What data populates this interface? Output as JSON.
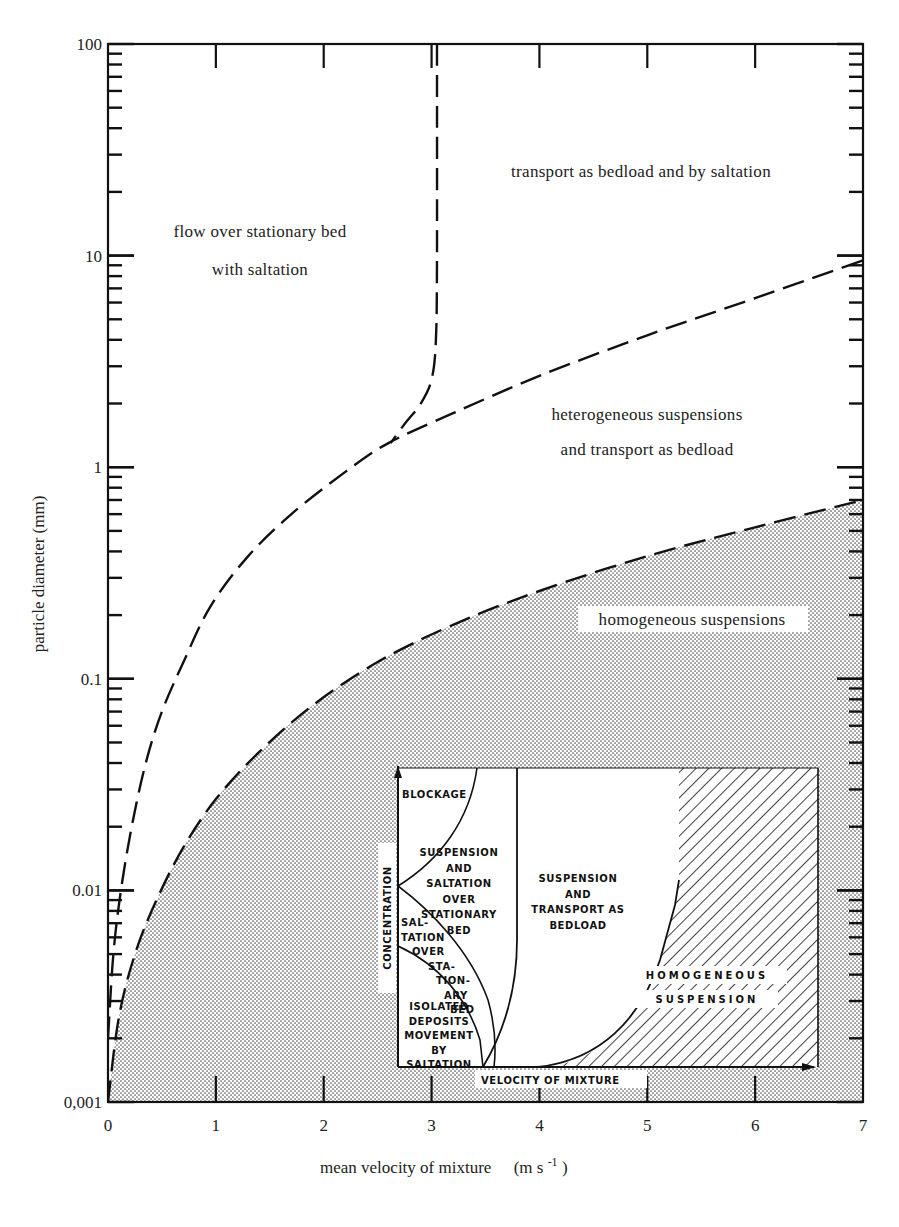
{
  "chart_data": [
    {
      "type": "area",
      "title": "",
      "xlabel": "mean velocity of mixture",
      "xlabel_units": "(m s-1)",
      "ylabel": "particle diameter (mm)",
      "yscale": "log",
      "xlim": [
        0,
        7
      ],
      "ylim": [
        0.001,
        100
      ],
      "x_ticks": [
        "0",
        "1",
        "2",
        "3",
        "4",
        "5",
        "6",
        "7"
      ],
      "y_ticks": [
        "0,001",
        "0.01",
        "0.1",
        "1",
        "10",
        "100"
      ],
      "grid": false,
      "series": [
        {
          "name": "boundary: stationary bed / bedload (vertical)",
          "style": "long-dash",
          "x": [
            3.05,
            3.05,
            3.04,
            3.0,
            2.9,
            2.75,
            2.62
          ],
          "y": [
            100,
            10,
            4,
            2.6,
            2.0,
            1.6,
            1.3
          ]
        },
        {
          "name": "boundary: bedload / heterogeneous suspension",
          "style": "long-dash",
          "x": [
            0.0,
            0.05,
            0.12,
            0.22,
            0.35,
            0.5,
            0.7,
            0.95,
            1.3,
            1.7,
            2.2,
            2.6,
            3.2,
            4.0,
            5.0,
            6.0,
            7.0
          ],
          "y": [
            0.002,
            0.005,
            0.01,
            0.02,
            0.04,
            0.07,
            0.12,
            0.22,
            0.38,
            0.6,
            0.95,
            1.3,
            1.8,
            2.7,
            4.2,
            6.3,
            9.5
          ]
        },
        {
          "name": "boundary: heterogeneous / homogeneous suspension",
          "style": "long-dash",
          "fill_below": "dotted",
          "x": [
            0.0,
            0.1,
            0.25,
            0.45,
            0.7,
            1.0,
            1.4,
            1.9,
            2.5,
            3.2,
            4.0,
            5.0,
            6.0,
            7.0
          ],
          "y": [
            0.001,
            0.0025,
            0.005,
            0.009,
            0.016,
            0.027,
            0.045,
            0.075,
            0.12,
            0.18,
            0.26,
            0.38,
            0.52,
            0.7
          ]
        }
      ],
      "annotations": [
        {
          "text": "flow over stationary bed",
          "x": 1.7,
          "y": 15
        },
        {
          "text": "with saltation",
          "x": 1.7,
          "y": 9
        },
        {
          "text": "transport as bedload and by saltation",
          "x": 5.1,
          "y": 35
        },
        {
          "text": "heterogeneous suspensions",
          "x": 5.0,
          "y": 1.5
        },
        {
          "text": "and transport as bedload",
          "x": 5.0,
          "y": 0.95
        },
        {
          "text": "homogeneous suspensions",
          "x": 5.5,
          "y": 0.17
        }
      ]
    },
    {
      "type": "diagram",
      "title": "inset: regime diagram",
      "xlabel": "VELOCITY OF MIXTURE",
      "ylabel": "CONCENTRATION",
      "regions": [
        {
          "label": [
            "BLOCKAGE"
          ]
        },
        {
          "label": [
            "SUSPENSION",
            "AND",
            "SALTATION",
            "OVER",
            "STATIONARY",
            "BED"
          ]
        },
        {
          "label": [
            "SAL-",
            "TATION",
            "OVER",
            "STA-",
            "TION-",
            "ARY",
            "BED"
          ]
        },
        {
          "label": [
            "ISOLATED",
            "DEPOSITS",
            "MOVEMENT",
            "BY",
            "SALTATION"
          ]
        },
        {
          "label": [
            "SUSPENSION",
            "AND",
            "TRANSPORT AS",
            "BEDLOAD"
          ]
        },
        {
          "label": [
            "HOMOGENEOUS",
            "SUSPENSION"
          ],
          "fill": "hatched"
        }
      ]
    }
  ],
  "axes": {
    "x": {
      "title": "mean velocity of mixture",
      "units_main": "(m s",
      "units_exp": "-1",
      "units_close": ")",
      "ticks": [
        {
          "label": "0",
          "value": 0
        },
        {
          "label": "1",
          "value": 1
        },
        {
          "label": "2",
          "value": 2
        },
        {
          "label": "3",
          "value": 3
        },
        {
          "label": "4",
          "value": 4
        },
        {
          "label": "5",
          "value": 5
        },
        {
          "label": "6",
          "value": 6
        },
        {
          "label": "7",
          "value": 7
        }
      ]
    },
    "y": {
      "title": "particle diameter (mm)",
      "ticks": [
        {
          "label": "100",
          "exp": 2
        },
        {
          "label": "10",
          "exp": 1
        },
        {
          "label": "1",
          "exp": 0
        },
        {
          "label": "0.1",
          "exp": -1
        },
        {
          "label": "0.01",
          "exp": -2
        },
        {
          "label": "0,001",
          "exp": -3
        }
      ]
    }
  },
  "labels": {
    "flow_stationary_1": "flow over stationary bed",
    "flow_stationary_2": "with saltation",
    "bedload_saltation": "transport as bedload and by saltation",
    "hetero_1": "heterogeneous suspensions",
    "hetero_2": "and transport as bedload",
    "homogeneous": "homogeneous suspensions"
  },
  "inset": {
    "x_axis_label": "VELOCITY OF MIXTURE",
    "y_axis_label": "CONCENTRATION",
    "blockage": "BLOCKAGE",
    "susp_salt": [
      "SUSPENSION",
      "AND",
      "SALTATION",
      "OVER",
      "STATIONARY",
      "BED"
    ],
    "salt_over": [
      "SAL-",
      "TATION",
      "OVER",
      "STA-",
      "TION-",
      "ARY",
      "BED"
    ],
    "isolated": [
      "ISOLATED",
      "DEPOSITS",
      "MOVEMENT",
      "BY",
      "SALTATION"
    ],
    "susp_bedload": [
      "SUSPENSION",
      "AND",
      "TRANSPORT AS",
      "BEDLOAD"
    ],
    "homog": [
      "HOMOGENEOUS",
      "SUSPENSION"
    ]
  },
  "colors": {
    "ink": "#111111",
    "paper": "#ffffff",
    "dots": "#555555"
  }
}
